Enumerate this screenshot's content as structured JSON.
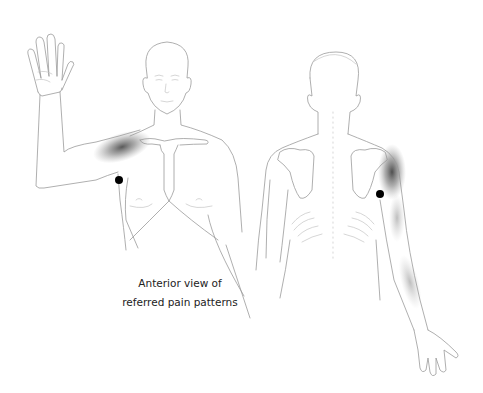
{
  "figure": {
    "title": "Referred pain patterns",
    "caption_lines": [
      "Anterior view of",
      "referred pain patterns"
    ],
    "views": [
      {
        "name": "anterior",
        "label": "Anterior view",
        "trigger_point": {
          "x": 119,
          "y": 180
        }
      },
      {
        "name": "posterior",
        "label": "Posterior view",
        "trigger_point": {
          "x": 380,
          "y": 194
        }
      }
    ],
    "colors": {
      "outline": "#9a9a9a",
      "pain_shading": "#4a4a4a",
      "trigger_point": "#000000",
      "background": "#ffffff",
      "caption_text": "#222222"
    }
  }
}
